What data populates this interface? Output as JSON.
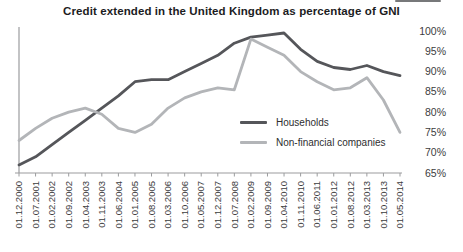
{
  "chart_data": {
    "type": "line",
    "title": "Credit extended in the United Kingdom as percentage of GNI",
    "categories": [
      "01.12.2000",
      "01.07.2001",
      "01.02.2002",
      "01.09.2002",
      "01.04.2003",
      "01.11.2003",
      "01.06.2004",
      "01.01.2005",
      "01.08.2005",
      "01.03.2006",
      "01.10.2006",
      "01.05.2007",
      "01.12.2007",
      "01.07.2008",
      "01.02.2009",
      "01.09.2009",
      "01.04.2010",
      "01.11.2010",
      "01.06.2011",
      "01.01.2012",
      "01.08.2012",
      "01.03.2013",
      "01.10.2013",
      "01.05.2014"
    ],
    "series": [
      {
        "name": "Households",
        "color": "#55565a",
        "values": [
          67,
          69,
          72,
          75,
          78,
          81,
          84,
          87.5,
          88,
          88,
          90,
          92,
          94,
          97,
          98.5,
          99,
          99.5,
          95.5,
          92.5,
          91,
          90.5,
          91.5,
          90,
          89
        ]
      },
      {
        "name": "Non-financial companies",
        "color": "#b3b5b8",
        "values": [
          73,
          76,
          78.5,
          80,
          81,
          79.5,
          76,
          75,
          77,
          81,
          83.5,
          85,
          86,
          85.5,
          98,
          96,
          94,
          90,
          87.5,
          85.5,
          86,
          88.5,
          83,
          75
        ]
      }
    ],
    "xlabel": "",
    "ylabel": "",
    "ylim": [
      65,
      100
    ],
    "yticks": [
      100,
      95,
      90,
      85,
      80,
      75,
      70,
      65
    ],
    "ytick_suffix": "%",
    "ytick_side": "right",
    "grid": false,
    "legend_position": "inside-right",
    "axis_color": "#9b9c9e",
    "tick_text_color": "#3c3c3e"
  }
}
